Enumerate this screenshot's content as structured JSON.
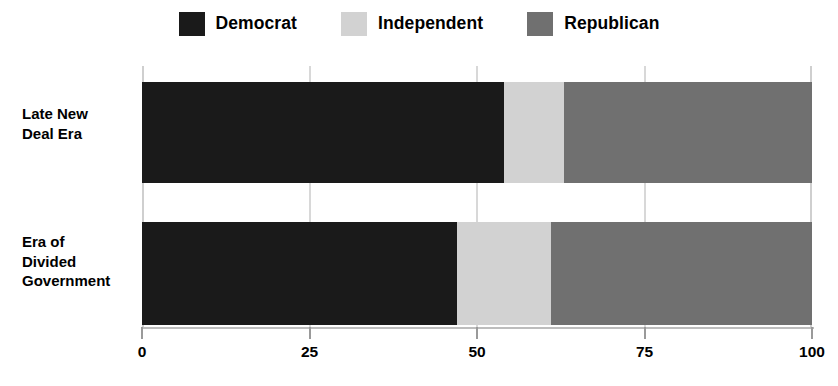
{
  "legend": {
    "position": "top-center",
    "entries": [
      {
        "label": "Democrat",
        "color": "#1a1a1a",
        "swatch_name": "legend-swatch-democrat"
      },
      {
        "label": "Independent",
        "color": "#d2d2d2",
        "swatch_name": "legend-swatch-independent"
      },
      {
        "label": "Republican",
        "color": "#707070",
        "swatch_name": "legend-swatch-republican"
      }
    ]
  },
  "categories": [
    {
      "label": "Late New\nDeal Era"
    },
    {
      "label": "Era of\nDivided\nGovernment"
    }
  ],
  "xaxis": {
    "ticks": [
      {
        "value": 0,
        "label": "0"
      },
      {
        "value": 25,
        "label": "25"
      },
      {
        "value": 50,
        "label": "50"
      },
      {
        "value": 75,
        "label": "75"
      },
      {
        "value": 100,
        "label": "100"
      }
    ]
  },
  "chart_data": {
    "type": "bar",
    "orientation": "horizontal",
    "stacked": true,
    "normalized": true,
    "title": "",
    "subtitle": "",
    "xlabel": "",
    "ylabel": "",
    "xlim": [
      0,
      100
    ],
    "grid": true,
    "grid_axis": "x",
    "legend_position": "top-center",
    "categories": [
      "Late New Deal Era",
      "Era of Divided Government"
    ],
    "series": [
      {
        "name": "Democrat",
        "color": "#1a1a1a",
        "values": [
          54,
          47
        ]
      },
      {
        "name": "Independent",
        "color": "#d2d2d2",
        "values": [
          9,
          14
        ]
      },
      {
        "name": "Republican",
        "color": "#707070",
        "values": [
          37,
          39
        ]
      }
    ],
    "cumulative_boundaries": [
      [
        54,
        63,
        100
      ],
      [
        47,
        61,
        100
      ]
    ]
  }
}
